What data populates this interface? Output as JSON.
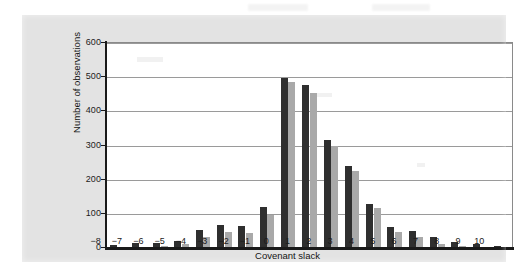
{
  "figure": {
    "panel_bg": "#e3e3e3",
    "plot_bg": "#ffffff",
    "axis_color": "#1a1a1a",
    "grid_color": "#9a9a9a"
  },
  "chart_data": {
    "type": "bar",
    "title": "",
    "subtitle": "",
    "xlabel": "Covenant slack",
    "ylabel": "Number of observations",
    "categories": [
      "-8",
      "-7",
      "-6",
      "-5",
      "-4",
      "-3",
      "-2",
      "-1",
      "0",
      "1",
      "2",
      "3",
      "4",
      "5",
      "6",
      "7",
      "8",
      "9",
      "10"
    ],
    "xtick_labels": [
      "−8",
      "−7",
      "−6",
      "−5",
      "−4",
      "−3",
      "−2",
      "−1",
      "0",
      "1",
      "2",
      "3",
      "4",
      "5",
      "6",
      "7",
      "8",
      "9",
      "10"
    ],
    "ytick_labels": [
      "0",
      "100",
      "200",
      "300",
      "400",
      "500",
      "600"
    ],
    "yticks": [
      0,
      100,
      200,
      300,
      400,
      500,
      600
    ],
    "ylim": [
      0,
      600
    ],
    "grid": true,
    "grid_axis": "y",
    "legend": "none",
    "series": [
      {
        "name": "series-1",
        "color": "#2f2f2f",
        "values": [
          8,
          15,
          16,
          21,
          53,
          68,
          65,
          120,
          497,
          477,
          315,
          240,
          130,
          62,
          50,
          33,
          18,
          11,
          6
        ]
      },
      {
        "name": "series-2",
        "color": "#a9a9a9",
        "values": [
          3,
          4,
          5,
          12,
          33,
          47,
          43,
          97,
          487,
          455,
          300,
          225,
          118,
          47,
          33,
          13,
          6,
          3,
          3
        ]
      }
    ]
  }
}
